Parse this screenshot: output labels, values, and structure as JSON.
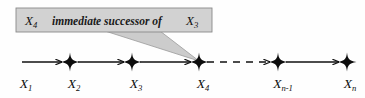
{
  "figure": {
    "type": "sequence-chain-diagram",
    "background_color": "#fefefe",
    "line_color": "#111111",
    "callout": {
      "fill_color": "#d2d2d2",
      "border_color": "#8a8a8a",
      "text_color": "#111111",
      "var_left": "X",
      "var_left_sub": "4",
      "phrase": "immediate successor of",
      "var_right": "X",
      "var_right_sub": "3",
      "full_text": "X4 immediate successor of X3",
      "box": {
        "x": 16,
        "y": 8,
        "width": 196,
        "height": 24
      },
      "pointer_tip": {
        "x": 199,
        "y": 61
      }
    },
    "axis": {
      "y": 62,
      "start_x": 22,
      "end_x": 352
    },
    "nodes": [
      {
        "id": "n1",
        "label_var": "X",
        "label_sub": "1",
        "marker": "none",
        "x": 22,
        "label_x": 26,
        "label_y": 88
      },
      {
        "id": "n2",
        "label_var": "X",
        "label_sub": "2",
        "marker": "star",
        "x": 70,
        "label_x": 74,
        "label_y": 88
      },
      {
        "id": "n3",
        "label_var": "X",
        "label_sub": "3",
        "marker": "star",
        "x": 132,
        "label_x": 136,
        "label_y": 88
      },
      {
        "id": "n4",
        "label_var": "X",
        "label_sub": "4",
        "marker": "star",
        "x": 199,
        "label_x": 203,
        "label_y": 88
      },
      {
        "id": "n5",
        "label_var": "X",
        "label_sub": "n-1",
        "marker": "star",
        "x": 278,
        "label_x": 270,
        "label_y": 88
      },
      {
        "id": "n6",
        "label_var": "X",
        "label_sub": "n",
        "marker": "star",
        "x": 347,
        "label_x": 340,
        "label_y": 88
      }
    ],
    "edges": [
      {
        "from": "n1",
        "to": "n2",
        "style": "solid",
        "x1": 22,
        "x2": 62
      },
      {
        "from": "n2",
        "to": "n3",
        "style": "solid",
        "x1": 78,
        "x2": 124
      },
      {
        "from": "n3",
        "to": "n4",
        "style": "solid",
        "x1": 140,
        "x2": 191
      },
      {
        "from": "n4",
        "to": "n5",
        "style": "dashed",
        "x1": 207,
        "x2": 270
      },
      {
        "from": "n5",
        "to": "n6",
        "style": "solid",
        "x1": 286,
        "x2": 339
      }
    ]
  }
}
